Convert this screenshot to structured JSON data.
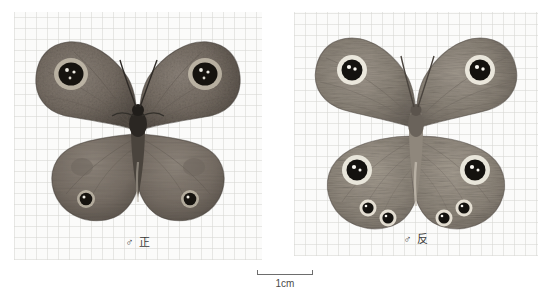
{
  "plate": {
    "background_color": "#ffffff",
    "panel_color": "#fbfbfa",
    "grid_line_color": "#d6d6d2"
  },
  "specimens": [
    {
      "id": "dorsal",
      "label": "♂ 正",
      "view": "dorsal",
      "sex_symbol": "♂",
      "view_char": "正",
      "eyespot_count": 4,
      "wing_color": "#7a7168",
      "wing_dark": "#4c463f",
      "eyespot_ring": "#d8d2c3",
      "eyespot_core": "#15120f",
      "eyespot_pupil": "#f2efe8"
    },
    {
      "id": "ventral",
      "label": "♂ 反",
      "view": "ventral",
      "sex_symbol": "♂",
      "view_char": "反",
      "eyespot_count": 8,
      "wing_color": "#8d867b",
      "wing_dark": "#5a534a",
      "eyespot_ring": "#f0ece0",
      "eyespot_core": "#141210",
      "eyespot_pupil": "#fbf9f3"
    }
  ],
  "scalebar": {
    "label": "1cm",
    "length_px": 56,
    "tick_color": "#6d6d6d"
  }
}
